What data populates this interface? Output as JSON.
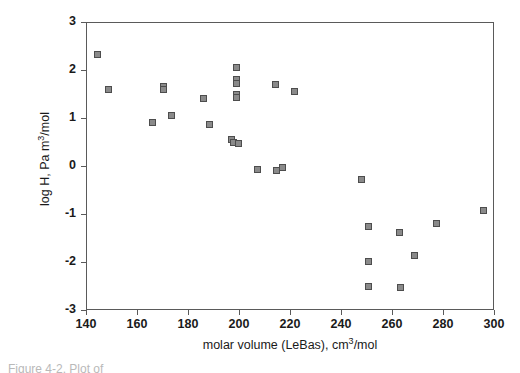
{
  "figure": {
    "caption_partial": "Figure 4-2. Plot of"
  },
  "axes": {
    "x_ticks": [
      "140",
      "160",
      "180",
      "200",
      "220",
      "240",
      "260",
      "280",
      "300"
    ],
    "y_ticks": [
      "3",
      "2",
      "1",
      "0",
      "-1",
      "-2",
      "-3"
    ],
    "xlabel_pre": "molar volume (LeBas), cm",
    "xlabel_sup": "3",
    "xlabel_post": "/mol",
    "ylabel_pre": "log H, Pa m",
    "ylabel_sup": "3",
    "ylabel_post": "/mol"
  },
  "style": {
    "marker_fill": "#8a8a8a",
    "marker_stroke": "#4d4d4d",
    "frame_color": "#5a5a5a",
    "background": "#ffffff",
    "text_color": "#1a1a1a"
  },
  "chart_data": {
    "type": "scatter",
    "title": "",
    "xlabel": "molar volume (LeBas), cm3/mol",
    "ylabel": "log H, Pa m3/mol",
    "xlim": [
      140,
      300
    ],
    "ylim": [
      -3,
      3
    ],
    "xticks": [
      140,
      160,
      180,
      200,
      220,
      240,
      260,
      280,
      300
    ],
    "yticks": [
      -3,
      -2,
      -1,
      0,
      1,
      2,
      3
    ],
    "grid": false,
    "legend": false,
    "marker": "square",
    "series": [
      {
        "name": "compounds",
        "points": [
          [
            144.0,
            2.35
          ],
          [
            148.5,
            1.62
          ],
          [
            165.5,
            0.92
          ],
          [
            170.0,
            1.68
          ],
          [
            170.0,
            1.62
          ],
          [
            173.0,
            1.07
          ],
          [
            185.5,
            1.43
          ],
          [
            188.0,
            0.88
          ],
          [
            196.5,
            0.58
          ],
          [
            197.5,
            0.51
          ],
          [
            198.5,
            2.08
          ],
          [
            198.5,
            1.82
          ],
          [
            198.5,
            1.74
          ],
          [
            198.5,
            1.52
          ],
          [
            198.5,
            1.45
          ],
          [
            199.5,
            0.5
          ],
          [
            207.0,
            -0.06
          ],
          [
            214.0,
            1.72
          ],
          [
            214.5,
            -0.07
          ],
          [
            216.5,
            0.0
          ],
          [
            221.5,
            1.57
          ],
          [
            247.5,
            -0.27
          ],
          [
            250.5,
            -1.23
          ],
          [
            250.5,
            -1.96
          ],
          [
            250.5,
            -2.49
          ],
          [
            262.5,
            -1.37
          ],
          [
            263.0,
            -2.52
          ],
          [
            268.5,
            -1.84
          ],
          [
            277.0,
            -1.17
          ],
          [
            295.5,
            -0.9
          ]
        ]
      }
    ]
  }
}
